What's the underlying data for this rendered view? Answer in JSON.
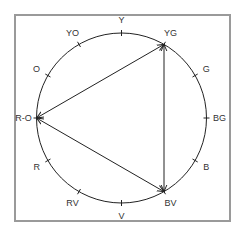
{
  "diagram": {
    "type": "color-wheel-triad",
    "frame": {
      "x": 15,
      "y": 15,
      "width": 215,
      "height": 206,
      "stroke": "#9a9a9a"
    },
    "circle": {
      "cx": 121.5,
      "cy": 118,
      "r": 85,
      "stroke": "#222222"
    },
    "hues": [
      {
        "label": "Y",
        "angle": -90
      },
      {
        "label": "YG",
        "angle": -60
      },
      {
        "label": "G",
        "angle": -30
      },
      {
        "label": "BG",
        "angle": 0
      },
      {
        "label": "B",
        "angle": 30
      },
      {
        "label": "BV",
        "angle": 60
      },
      {
        "label": "V",
        "angle": 90
      },
      {
        "label": "RV",
        "angle": 120
      },
      {
        "label": "R",
        "angle": 150
      },
      {
        "label": "R-O",
        "angle": 180
      },
      {
        "label": "O",
        "angle": 210
      },
      {
        "label": "YO",
        "angle": 240
      }
    ],
    "triad": {
      "vertices": [
        "YG",
        "BV",
        "R-O"
      ],
      "edges": [
        {
          "from": "R-O",
          "to": "YG",
          "arrows": "both"
        },
        {
          "from": "YG",
          "to": "BV",
          "arrows": "both"
        },
        {
          "from": "BV",
          "to": "R-O",
          "arrows": "both"
        }
      ]
    }
  }
}
